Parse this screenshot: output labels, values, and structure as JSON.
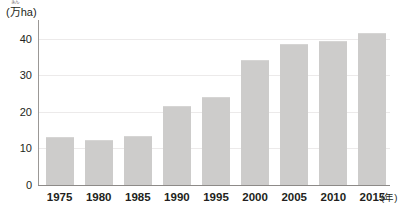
{
  "chart_data": {
    "type": "bar",
    "title": "",
    "subtitle": "",
    "xlabel": "(年)",
    "ylabel": "(万ha)",
    "ylabel_ruby": "まん",
    "ylim": [
      0,
      44
    ],
    "grid": true,
    "gridlines_at": [
      10,
      20,
      30,
      40
    ],
    "legend": null,
    "legend_position": "none",
    "categories": [
      "1975",
      "1980",
      "1985",
      "1990",
      "1995",
      "2000",
      "2005",
      "2010",
      "2015"
    ],
    "values": [
      13.0,
      12.2,
      13.3,
      21.5,
      24.2,
      34.2,
      38.5,
      39.5,
      41.5
    ],
    "y_ticks": [
      "0",
      "10",
      "20",
      "30",
      "40"
    ],
    "y_tick_values": [
      0,
      10,
      20,
      30,
      40
    ],
    "bar_color": "#cdcccb",
    "axis_color": "#8d8a88",
    "grid_color": "#eceaea",
    "text_color": "#231f20",
    "background": "#ffffff"
  },
  "axes": {
    "y_unit_prefix": "(",
    "y_unit_ruby": "まん",
    "y_unit_kanji": "万",
    "y_unit_suffix": "ha)",
    "x_unit": "(年)"
  }
}
